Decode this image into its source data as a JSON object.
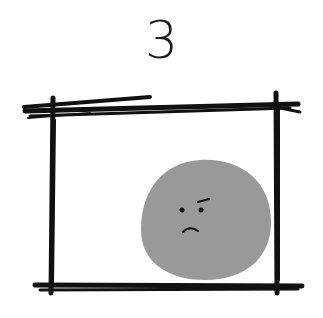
{
  "panel": {
    "number": "3",
    "frame_color": "#111111",
    "blob_color": "#999999",
    "face_expression": "frowning"
  }
}
